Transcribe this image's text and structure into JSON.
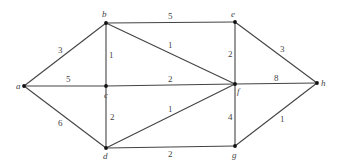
{
  "nodes": [
    {
      "id": "a",
      "label": "a",
      "x": 24,
      "y": 86,
      "lx": 16,
      "ly": 89
    },
    {
      "id": "b",
      "label": "b",
      "x": 106,
      "y": 23,
      "lx": 102,
      "ly": 17
    },
    {
      "id": "c",
      "label": "c",
      "x": 106,
      "y": 86,
      "lx": 104,
      "ly": 98
    },
    {
      "id": "d",
      "label": "d",
      "x": 106,
      "y": 148,
      "lx": 103,
      "ly": 159
    },
    {
      "id": "e",
      "label": "e",
      "x": 235,
      "y": 22,
      "lx": 231,
      "ly": 17
    },
    {
      "id": "f",
      "label": "f",
      "x": 235,
      "y": 84,
      "lx": 237,
      "ly": 94
    },
    {
      "id": "g",
      "label": "g",
      "x": 235,
      "y": 146,
      "lx": 232,
      "ly": 158
    },
    {
      "id": "h",
      "label": "h",
      "x": 317,
      "y": 83,
      "lx": 321,
      "ly": 86
    }
  ],
  "edges": [
    {
      "from": "a",
      "to": "b",
      "weight": "3",
      "wx": 58,
      "wy": 53
    },
    {
      "from": "a",
      "to": "c",
      "weight": "5",
      "wx": 66,
      "wy": 82
    },
    {
      "from": "a",
      "to": "d",
      "weight": "6",
      "wx": 58,
      "wy": 126
    },
    {
      "from": "b",
      "to": "c",
      "weight": "1",
      "wx": 109,
      "wy": 58
    },
    {
      "from": "c",
      "to": "d",
      "weight": "2",
      "wx": 110,
      "wy": 120
    },
    {
      "from": "b",
      "to": "e",
      "weight": "5",
      "wx": 168,
      "wy": 19
    },
    {
      "from": "b",
      "to": "f",
      "weight": "1",
      "wx": 168,
      "wy": 48
    },
    {
      "from": "c",
      "to": "f",
      "weight": "2",
      "wx": 168,
      "wy": 82
    },
    {
      "from": "d",
      "to": "f",
      "weight": "1",
      "wx": 168,
      "wy": 112
    },
    {
      "from": "d",
      "to": "g",
      "weight": "2",
      "wx": 168,
      "wy": 157
    },
    {
      "from": "e",
      "to": "f",
      "weight": "2",
      "wx": 228,
      "wy": 57
    },
    {
      "from": "f",
      "to": "g",
      "weight": "4",
      "wx": 228,
      "wy": 120
    },
    {
      "from": "e",
      "to": "h",
      "weight": "3",
      "wx": 280,
      "wy": 52
    },
    {
      "from": "f",
      "to": "h",
      "weight": "8",
      "wx": 274,
      "wy": 81
    },
    {
      "from": "g",
      "to": "h",
      "weight": "1",
      "wx": 280,
      "wy": 122
    }
  ]
}
